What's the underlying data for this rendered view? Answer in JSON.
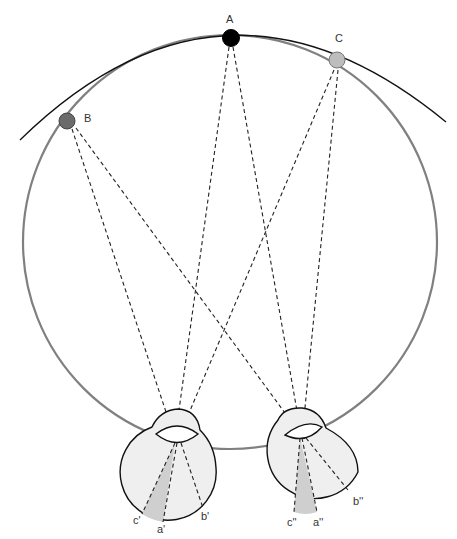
{
  "diagram": {
    "colors": {
      "horopter_circle": "#808080",
      "horopter_arc": "#111111",
      "point_A": "#000000",
      "point_B": "#6b6b6b",
      "point_C": "#bdbdbd",
      "eye_fill": "#efefef",
      "sector_fill": "#cfcfcf",
      "ray": "#222222"
    },
    "points": [
      {
        "id": "A",
        "label": "A"
      },
      {
        "id": "B",
        "label": "B"
      },
      {
        "id": "C",
        "label": "C"
      }
    ],
    "left_eye": {
      "labels": {
        "c": "c'",
        "a": "a'",
        "b": "b'"
      }
    },
    "right_eye": {
      "labels": {
        "c": "c''",
        "a": "a''",
        "b": "b''"
      }
    }
  }
}
